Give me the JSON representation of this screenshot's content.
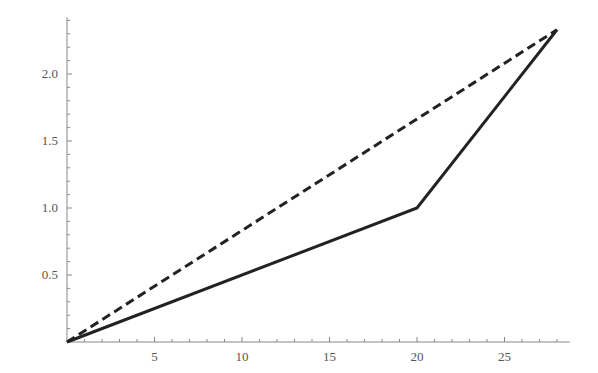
{
  "chart_data": {
    "type": "line",
    "title": "",
    "xlabel": "",
    "ylabel": "",
    "xlim": [
      0,
      28.5
    ],
    "ylim": [
      0,
      2.4
    ],
    "grid": false,
    "legend": null,
    "x_ticks": [
      5,
      10,
      15,
      20,
      25
    ],
    "x_tick_labels": [
      "5",
      "10",
      "15",
      "20",
      "25"
    ],
    "y_ticks": [
      0.5,
      1.0,
      1.5,
      2.0
    ],
    "y_tick_labels": [
      "0.5",
      "1.0",
      "1.5",
      "2.0"
    ],
    "series": [
      {
        "name": "solid",
        "style": "solid",
        "color": "#222222",
        "points": [
          [
            0,
            0
          ],
          [
            20,
            1.0
          ],
          [
            28,
            2.33
          ]
        ]
      },
      {
        "name": "dashed",
        "style": "dashed",
        "color": "#222222",
        "points": [
          [
            0,
            0
          ],
          [
            28,
            2.33
          ]
        ]
      }
    ]
  },
  "colors": {
    "axis": "#888888",
    "line": "#222222",
    "label": "#555555"
  }
}
